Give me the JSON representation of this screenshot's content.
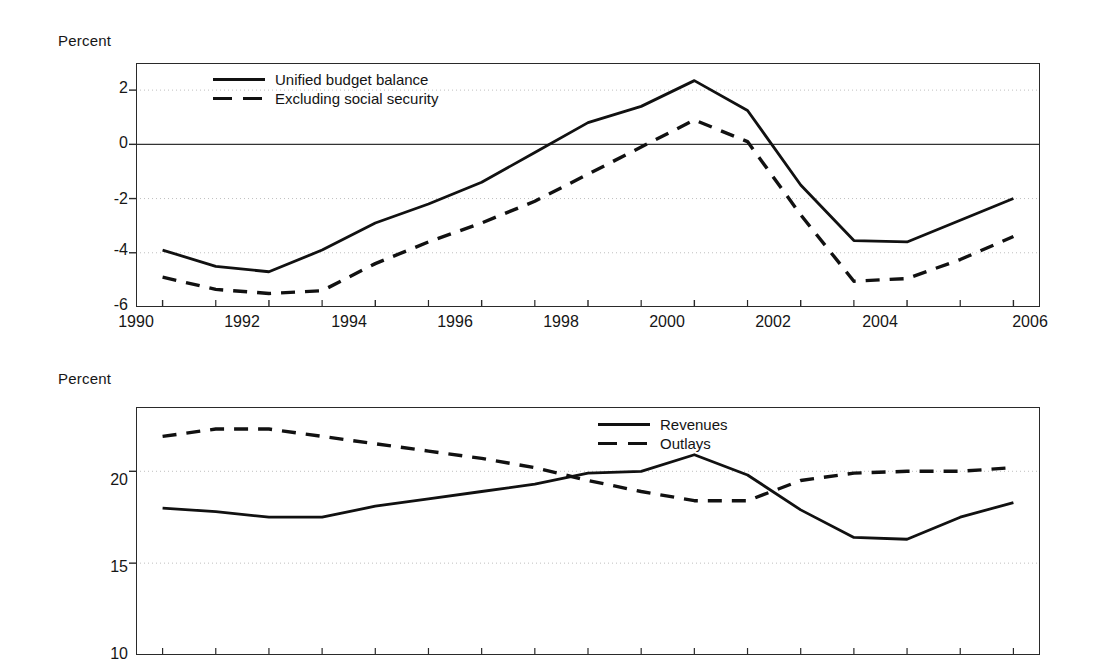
{
  "figure": {
    "background": "#ffffff",
    "line_color": "#111111"
  },
  "chart_data": [
    {
      "type": "line",
      "panel": "top",
      "title": "",
      "ylabel": "Percent",
      "xlabel": "",
      "xlim": [
        1989.5,
        2006.5
      ],
      "ylim": [
        -6,
        3
      ],
      "yticks": [
        "2",
        "0",
        "-2",
        "-4",
        "-6"
      ],
      "ytick_values": [
        2,
        0,
        -2,
        -4,
        -6
      ],
      "xticks": [
        "1990",
        "1992",
        "1994",
        "1996",
        "1998",
        "2000",
        "2002",
        "2004",
        "2006"
      ],
      "xtick_values": [
        1990,
        1992,
        1994,
        1996,
        1998,
        2000,
        2002,
        2004,
        2006
      ],
      "minor_xticks": [
        1991,
        1993,
        1995,
        1997,
        1999,
        2001,
        2003,
        2005
      ],
      "grid": "horizontal dotted at yticks",
      "zero_line": true,
      "legend_position": "top-center-inside",
      "x": [
        1990,
        1991,
        1992,
        1993,
        1994,
        1995,
        1996,
        1997,
        1998,
        1999,
        2000,
        2001,
        2002,
        2003,
        2004,
        2005,
        2006
      ],
      "series": [
        {
          "name": "Unified budget balance",
          "style": "solid",
          "values": [
            -3.9,
            -4.5,
            -4.7,
            -3.9,
            -2.9,
            -2.2,
            -1.4,
            -0.3,
            0.8,
            1.4,
            2.35,
            1.25,
            -1.5,
            -3.55,
            -3.6,
            -2.8,
            -2.0
          ]
        },
        {
          "name": "Excluding social security",
          "style": "dashed",
          "values": [
            -4.9,
            -5.35,
            -5.5,
            -5.4,
            -4.4,
            -3.6,
            -2.9,
            -2.1,
            -1.1,
            -0.1,
            0.9,
            0.1,
            -2.6,
            -5.05,
            -4.95,
            -4.25,
            -3.4
          ]
        }
      ]
    },
    {
      "type": "line",
      "panel": "bottom",
      "title": "",
      "ylabel": "Percent",
      "xlabel": "",
      "xlim": [
        1989.5,
        2006.5
      ],
      "ylim": [
        10,
        23.5
      ],
      "yticks": [
        "20",
        "15",
        "10"
      ],
      "ytick_values": [
        20,
        15,
        10
      ],
      "xticks": [],
      "minor_xticks": [
        1990,
        1991,
        1992,
        1993,
        1994,
        1995,
        1996,
        1997,
        1998,
        1999,
        2000,
        2001,
        2002,
        2003,
        2004,
        2005,
        2006
      ],
      "grid": "horizontal dotted at yticks",
      "zero_line": false,
      "legend_position": "top-center-inside",
      "x": [
        1990,
        1991,
        1992,
        1993,
        1994,
        1995,
        1996,
        1997,
        1998,
        1999,
        2000,
        2001,
        2002,
        2003,
        2004,
        2005,
        2006
      ],
      "series": [
        {
          "name": "Revenues",
          "style": "solid",
          "values": [
            18.0,
            17.8,
            17.5,
            17.5,
            18.1,
            18.5,
            18.9,
            19.3,
            19.9,
            20.0,
            20.9,
            19.8,
            17.9,
            16.4,
            16.3,
            17.5,
            18.3
          ]
        },
        {
          "name": "Outlays",
          "style": "dashed",
          "values": [
            21.9,
            22.3,
            22.3,
            21.9,
            21.5,
            21.1,
            20.7,
            20.2,
            19.5,
            18.9,
            18.4,
            18.4,
            19.5,
            19.9,
            20.0,
            20.0,
            20.2
          ]
        }
      ]
    }
  ]
}
